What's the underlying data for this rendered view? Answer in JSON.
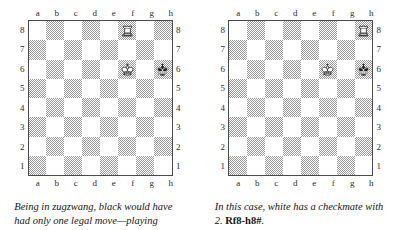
{
  "figure": {
    "board_size": 8,
    "file_labels": [
      "a",
      "b",
      "c",
      "d",
      "e",
      "f",
      "g",
      "h"
    ],
    "rank_labels": [
      "8",
      "7",
      "6",
      "5",
      "4",
      "3",
      "2",
      "1"
    ],
    "colors": {
      "light_square": "#ffffff",
      "dark_square": "#9a9a9a",
      "border": "#4a4a4a",
      "text": "#151515",
      "white_piece_fill": "#ffffff",
      "white_piece_stroke": "#333333",
      "black_piece_fill": "#1f1f1f"
    }
  },
  "diagrams": [
    {
      "id": "diagram-left",
      "position_name": "zugzwang-position",
      "pieces": [
        {
          "piece": "rook",
          "color": "white",
          "square": "f8",
          "file": "f",
          "rank": "8",
          "glyph": "white-rook-icon"
        },
        {
          "piece": "king",
          "color": "white",
          "square": "f6",
          "file": "f",
          "rank": "6",
          "glyph": "white-king-icon"
        },
        {
          "piece": "king",
          "color": "black",
          "square": "h6",
          "file": "h",
          "rank": "6",
          "glyph": "black-king-icon"
        }
      ],
      "caption": {
        "text_before": "Being in zugzwang, black would have had only one legal move—playing",
        "notation": "",
        "text_after": ""
      }
    },
    {
      "id": "diagram-right",
      "position_name": "checkmate-position",
      "pieces": [
        {
          "piece": "rook",
          "color": "white",
          "square": "h8",
          "file": "h",
          "rank": "8",
          "glyph": "white-rook-icon"
        },
        {
          "piece": "king",
          "color": "white",
          "square": "f6",
          "file": "f",
          "rank": "6",
          "glyph": "white-king-icon"
        },
        {
          "piece": "king",
          "color": "black",
          "square": "h6",
          "file": "h",
          "rank": "6",
          "glyph": "black-king-icon"
        }
      ],
      "caption": {
        "text_before": "In this case, white has a checkmate with 2. ",
        "notation": "Rf8-h8#",
        "text_after": "."
      }
    }
  ]
}
